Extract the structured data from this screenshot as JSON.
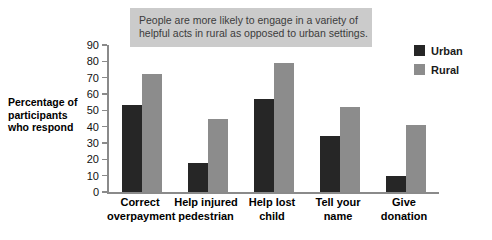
{
  "chart_data": {
    "type": "bar",
    "title": "",
    "subtitle": "",
    "xlabel": "",
    "ylabel": "Percentage of participants who respond",
    "ylim": [
      0,
      90
    ],
    "yticks": [
      0,
      10,
      20,
      30,
      40,
      50,
      60,
      70,
      80,
      90
    ],
    "grid": false,
    "legend_position": "top-right",
    "categories": [
      "Correct overpayment",
      "Help injured pedestrian",
      "Help lost child",
      "Tell your name",
      "Give donation"
    ],
    "series": [
      {
        "name": "Urban",
        "color": "#262626",
        "values": [
          53,
          18,
          57,
          34,
          9.5
        ]
      },
      {
        "name": "Rural",
        "color": "#8c8c8c",
        "values": [
          72,
          45,
          79,
          52,
          41
        ]
      }
    ],
    "annotations": [
      {
        "id": "callout",
        "lines": [
          "People are more likely to engage in a variety of",
          "helpful acts in rural as opposed to urban settings."
        ],
        "background": "#cbcbcb",
        "text_color": "#3c3c3c"
      }
    ]
  },
  "ylabel_lines": [
    "Percentage of",
    "participants",
    "who respond"
  ],
  "xlabel_lines": [
    [
      "Correct",
      "overpayment"
    ],
    [
      "Help injured",
      "pedestrian"
    ],
    [
      "Help lost",
      "child"
    ],
    [
      "Tell your",
      "name"
    ],
    [
      "Give",
      "donation"
    ]
  ],
  "axis_color": "#8a8a8a"
}
